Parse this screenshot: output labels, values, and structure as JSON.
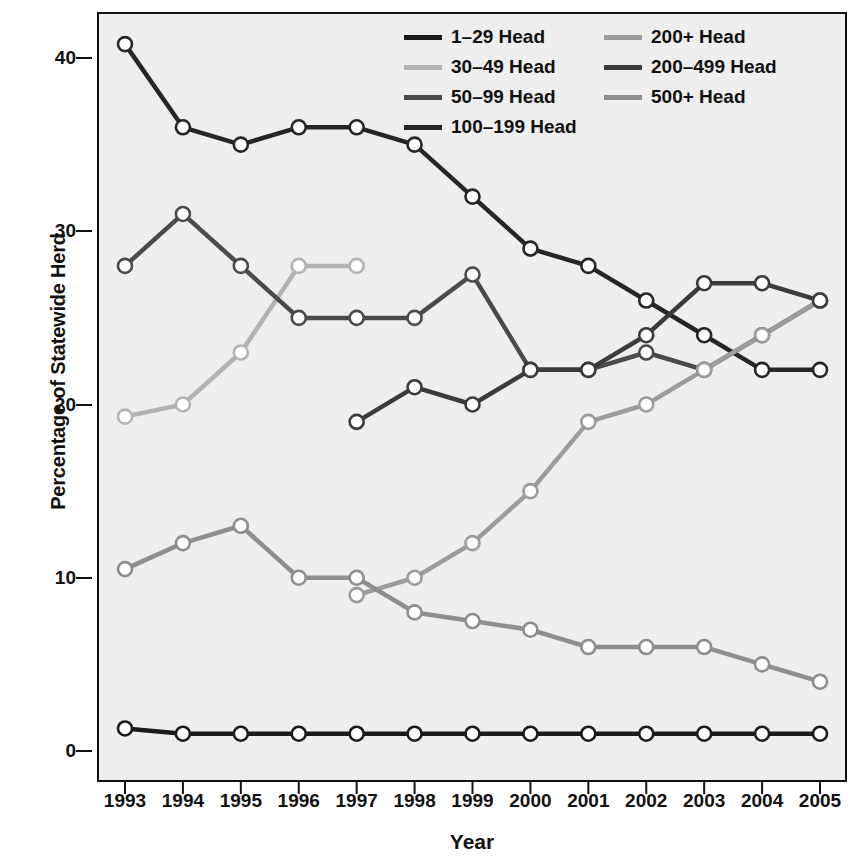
{
  "chart_data": {
    "type": "line",
    "title": "",
    "xlabel": "Year",
    "ylabel": "Percentage of Statewide Herd",
    "categories": [
      "1993",
      "1994",
      "1995",
      "1996",
      "1997",
      "1998",
      "1999",
      "2000",
      "2001",
      "2002",
      "2003",
      "2004",
      "2005"
    ],
    "x": [
      1993,
      1994,
      1995,
      1996,
      1997,
      1998,
      1999,
      2000,
      2001,
      2002,
      2003,
      2004,
      2005
    ],
    "xlim": [
      1993,
      2005
    ],
    "ylim": [
      0,
      44
    ],
    "yticks": [
      0,
      10,
      20,
      30,
      40
    ],
    "grid": false,
    "legend_position": "top-right",
    "series": [
      {
        "name": "1-29 Head",
        "label": "1–29 Head",
        "color": "#1b1b1b",
        "values": [
          1.3,
          1,
          1,
          1,
          1,
          1,
          1,
          1,
          1,
          1,
          1,
          1,
          1
        ]
      },
      {
        "name": "30-49 Head",
        "label": "30–49 Head",
        "color": "#b3b3b3",
        "values": [
          19.3,
          20,
          23,
          28,
          28,
          null,
          null,
          null,
          null,
          null,
          null,
          null,
          null
        ]
      },
      {
        "name": "50-99 Head",
        "label": "50–99 Head",
        "color": "#4a4a4a",
        "values": [
          28,
          31,
          28,
          25,
          25,
          25,
          27.5,
          22,
          22,
          23,
          22,
          24,
          26
        ]
      },
      {
        "name": "100-199 Head",
        "label": "100–199 Head",
        "color": "#262626",
        "values": [
          40.8,
          36,
          35,
          36,
          36,
          35,
          32,
          29,
          28,
          26,
          24,
          22,
          22
        ]
      },
      {
        "name": "200+ Head",
        "label": "200+ Head",
        "color": "#9c9c9c",
        "values": [
          null,
          null,
          null,
          null,
          9,
          10,
          12,
          15,
          19,
          20,
          22,
          24,
          26
        ]
      },
      {
        "name": "200-499 Head",
        "label": "200–499 Head",
        "color": "#3b3b3b",
        "values": [
          null,
          null,
          null,
          null,
          19,
          21,
          20,
          22,
          22,
          24,
          27,
          27,
          26
        ]
      },
      {
        "name": "500+ Head",
        "label": "500+ Head",
        "color": "#8e8e8e",
        "values": [
          10.5,
          12,
          13,
          10,
          10,
          8,
          7.5,
          7,
          6,
          6,
          6,
          5,
          4
        ]
      }
    ]
  },
  "legend": {
    "column_left": [
      "1–29 Head",
      "30–49 Head",
      "50–99 Head",
      "100–199 Head"
    ],
    "column_right": [
      "200+ Head",
      "200–499 Head",
      "500+ Head"
    ]
  },
  "style": {
    "plot_background": "#eeeeee",
    "page_background": "#ffffff",
    "axis_color": "#111111",
    "marker_fill": "#ffffff",
    "marker_stroke": "#111111"
  }
}
